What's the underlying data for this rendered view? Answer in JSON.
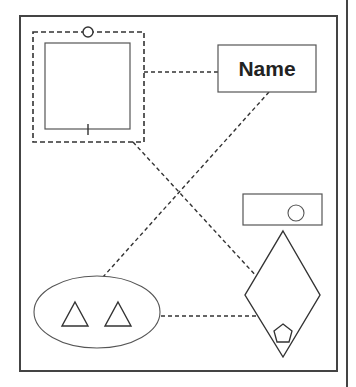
{
  "diagram": {
    "labels": {
      "name_box": "Name"
    },
    "colors": {
      "stroke": "#333333",
      "shape_stroke": "#555555",
      "background": "#ffffff"
    },
    "shapes": [
      {
        "id": "outer-frame",
        "type": "rect"
      },
      {
        "id": "dashed-container",
        "type": "dashed-rect",
        "decorations": [
          "top-circle-port"
        ]
      },
      {
        "id": "inner-square",
        "type": "rect",
        "decorations": [
          "bottom-tick"
        ]
      },
      {
        "id": "name-box",
        "type": "rect",
        "label": "Name"
      },
      {
        "id": "small-rect-with-circle",
        "type": "rect",
        "contains": [
          "circle"
        ]
      },
      {
        "id": "diamond",
        "type": "diamond",
        "contains": [
          "pentagon"
        ]
      },
      {
        "id": "ellipse",
        "type": "ellipse",
        "contains": [
          "triangle",
          "triangle"
        ]
      }
    ],
    "connectors": [
      {
        "from": "dashed-container",
        "to": "name-box",
        "style": "dashed"
      },
      {
        "from": "dashed-container",
        "to": "diamond",
        "style": "dashed"
      },
      {
        "from": "name-box",
        "to": "ellipse",
        "style": "dashed"
      },
      {
        "from": "ellipse",
        "to": "diamond",
        "style": "dashed"
      }
    ]
  }
}
